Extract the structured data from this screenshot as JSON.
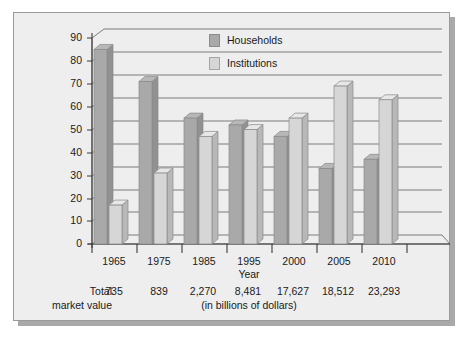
{
  "chart_data": {
    "type": "bar",
    "title": "",
    "xlabel": "Year",
    "ylabel": "",
    "ylim": [
      0,
      90
    ],
    "ytick_step": 10,
    "yticks": [
      "90",
      "80",
      "70",
      "60",
      "50",
      "40",
      "30",
      "20",
      "10",
      "0"
    ],
    "grid": true,
    "legend_position": "top-center",
    "categories": [
      "1965",
      "1975",
      "1985",
      "1995",
      "2000",
      "2005",
      "2010"
    ],
    "series": [
      {
        "name": "Households",
        "color": "#a9a9a9",
        "values": [
          85,
          71,
          55,
          52,
          47,
          33,
          37
        ]
      },
      {
        "name": "Institutions",
        "color": "#d6d6d6",
        "values": [
          17,
          31,
          47,
          50,
          55,
          69,
          63
        ]
      }
    ],
    "annotations": {
      "total_label_line1": "Total",
      "total_label_line2": "market value",
      "totals": [
        "735",
        "839",
        "2,270",
        "8,481",
        "17,627",
        "18,512",
        "23,293"
      ],
      "units_note": "(in billions of dollars)"
    }
  },
  "legend": {
    "items": [
      {
        "label": "Households",
        "swatch": "households-swatch"
      },
      {
        "label": "Institutions",
        "swatch": "institutions-swatch"
      }
    ]
  },
  "colors": {
    "households": "#a9a9a9",
    "institutions": "#d6d6d6",
    "panel_background": "#eeeeee",
    "frame_border": "#9a9a9a",
    "gridline": "#6e6e6e",
    "text": "#1a1a1a"
  }
}
